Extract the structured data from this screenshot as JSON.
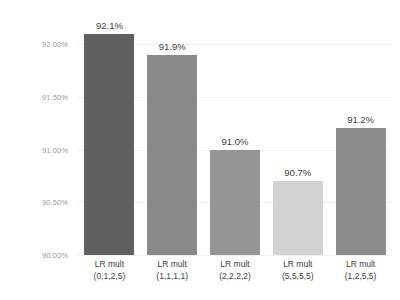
{
  "chart_data": {
    "type": "bar",
    "title": "",
    "subtitle": "",
    "xlabel": "",
    "ylabel": "",
    "categories": [
      "LR mult (0,1,2,5)",
      "LR mult (1,1,1,1)",
      "LR mult (2,2,2,2)",
      "LR mult (5,5,5,5)",
      "LR mult (1,2,5,5)"
    ],
    "category_lines": [
      {
        "line1": "LR mult",
        "line2": "(0,1,2,5)"
      },
      {
        "line1": "LR mult",
        "line2": "(1,1,1,1)"
      },
      {
        "line1": "LR mult",
        "line2": "(2,2,2,2)"
      },
      {
        "line1": "LR mult",
        "line2": "(5,5,5,5)"
      },
      {
        "line1": "LR mult",
        "line2": "(1,2,5,5)"
      }
    ],
    "values": [
      92.1,
      91.9,
      91.0,
      90.7,
      91.2
    ],
    "value_labels": [
      "92.1%",
      "91.9%",
      "91.0%",
      "90.7%",
      "91.2%"
    ],
    "bar_colors": [
      "#606060",
      "#8a8a8a",
      "#959595",
      "#d2d2d2",
      "#8d8d8d"
    ],
    "ylim": [
      90.0,
      92.2
    ],
    "yticks": [
      90.0,
      90.5,
      91.0,
      91.5,
      92.0
    ],
    "ytick_labels": [
      "90.00%",
      "90.50%",
      "91.00%",
      "91.50%",
      "92.00%"
    ],
    "grid": true,
    "legend": "none",
    "axis_label_color": "#9a9a9a",
    "data_label_color": "#3d3d3d",
    "gridline_color": "#f1f1f1",
    "background_color": "#ffffff"
  },
  "artifact_text": "· · · ·"
}
